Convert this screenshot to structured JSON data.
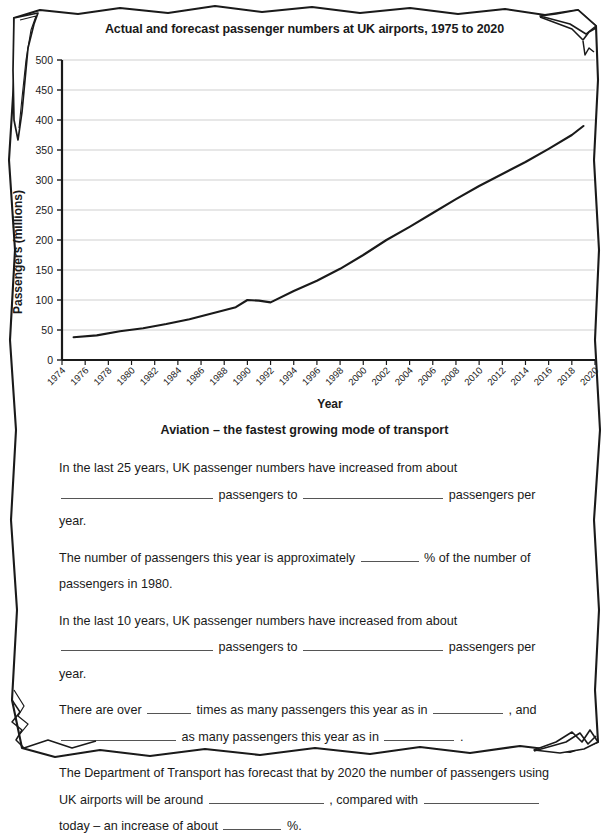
{
  "document": {
    "type": "worksheet-page",
    "paper_style": "torn-edge-note-paper"
  },
  "chart_data": {
    "type": "line",
    "title": "Actual and forecast passenger numbers at UK airports, 1975 to 2020",
    "xlabel": "Year",
    "ylabel": "Passengers (millions)",
    "xlim": [
      1974,
      2020
    ],
    "ylim": [
      0,
      500
    ],
    "ytick_step": 50,
    "xtick_step": 2,
    "grid": "horizontal",
    "legend": "none",
    "xticks": [
      "1974",
      "1976",
      "1978",
      "1980",
      "1982",
      "1984",
      "1986",
      "1988",
      "1990",
      "1992",
      "1994",
      "1996",
      "1998",
      "2000",
      "2002",
      "2004",
      "2006",
      "2008",
      "2010",
      "2012",
      "2014",
      "2016",
      "2018",
      "2020"
    ],
    "yticks": [
      "0",
      "50",
      "100",
      "150",
      "200",
      "250",
      "300",
      "350",
      "400",
      "450",
      "500"
    ],
    "series": [
      {
        "name": "UK airport passengers",
        "x": [
          1975,
          1977,
          1979,
          1981,
          1983,
          1985,
          1987,
          1989,
          1990,
          1991,
          1992,
          1994,
          1996,
          1998,
          2000,
          2002,
          2004,
          2006,
          2008,
          2010,
          2012,
          2014,
          2016,
          2018,
          2019
        ],
        "values": [
          38,
          41,
          48,
          53,
          60,
          68,
          78,
          88,
          100,
          99,
          96,
          115,
          132,
          152,
          175,
          200,
          222,
          245,
          268,
          290,
          310,
          330,
          352,
          375,
          390
        ]
      }
    ]
  },
  "worksheet": {
    "heading": "Aviation – the fastest growing mode of transport",
    "paragraphs": [
      {
        "id": "p1",
        "segments": [
          {
            "t": "text",
            "v": "In the last 25 years, UK passenger numbers have increased from about"
          },
          {
            "t": "break"
          },
          {
            "t": "blank",
            "size": "xl"
          },
          {
            "t": "text",
            "v": "passengers to"
          },
          {
            "t": "blank",
            "size": "lg"
          },
          {
            "t": "text",
            "v": "passengers per year."
          }
        ]
      },
      {
        "id": "p2",
        "segments": [
          {
            "t": "text",
            "v": "The number of passengers this year is approximately"
          },
          {
            "t": "blank",
            "size": "sm"
          },
          {
            "t": "text",
            "v": "% of the number of passengers in 1980."
          }
        ]
      },
      {
        "id": "p3",
        "segments": [
          {
            "t": "text",
            "v": "In the last 10 years, UK passenger numbers have increased from about"
          },
          {
            "t": "break"
          },
          {
            "t": "blank",
            "size": "xl"
          },
          {
            "t": "text",
            "v": "passengers to"
          },
          {
            "t": "blank",
            "size": "lg"
          },
          {
            "t": "text",
            "v": "passengers per year."
          }
        ]
      },
      {
        "id": "p4",
        "segments": [
          {
            "t": "text",
            "v": "There are over"
          },
          {
            "t": "blank",
            "size": "xs"
          },
          {
            "t": "text",
            "v": "times as many passengers this year as in"
          },
          {
            "t": "blank",
            "size": "t"
          },
          {
            "t": "text",
            "v": ", and"
          },
          {
            "t": "blank",
            "size": "md"
          },
          {
            "t": "text",
            "v": "as many passengers this year as in"
          },
          {
            "t": "blank",
            "size": "t"
          },
          {
            "t": "text",
            "v": "."
          }
        ]
      },
      {
        "id": "p5",
        "segments": [
          {
            "t": "text",
            "v": "The Department of Transport has forecast that by 2020 the number of passengers using UK airports will be around"
          },
          {
            "t": "blank",
            "size": "md"
          },
          {
            "t": "text",
            "v": ", compared with"
          },
          {
            "t": "blank",
            "size": "md"
          },
          {
            "t": "text",
            "v": "today – an increase of about"
          },
          {
            "t": "blank",
            "size": "sm"
          },
          {
            "t": "text",
            "v": "%."
          }
        ]
      }
    ]
  },
  "colors": {
    "line": "#1a1a1a",
    "grid": "#cfcfcf",
    "axis": "#1a1a1a",
    "text": "#1a1a1a",
    "blank_rule": "#555555",
    "paper": "#ffffff"
  }
}
